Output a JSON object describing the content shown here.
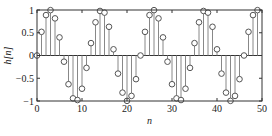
{
  "chart_data": {
    "type": "stem",
    "title": "",
    "xlabel": "n",
    "ylabel": "h[n]",
    "xlim": [
      0,
      50
    ],
    "ylim": [
      -1,
      1
    ],
    "grid": false,
    "legend": null,
    "xticks": [
      0,
      10,
      20,
      30,
      40,
      50
    ],
    "xtick_labels": [
      "0",
      "10",
      "20",
      "30",
      "40",
      "50"
    ],
    "yticks": [
      -1,
      -0.5,
      0,
      0.5,
      1
    ],
    "ytick_labels": [
      "−1",
      "−0.5",
      "0",
      "0.5",
      "1"
    ],
    "marker": "open-circle",
    "stem_color": "#888888",
    "marker_color": "#555555",
    "x": [
      0,
      1,
      2,
      3,
      4,
      5,
      6,
      7,
      8,
      9,
      10,
      11,
      12,
      13,
      14,
      15,
      16,
      17,
      18,
      19,
      20,
      21,
      22,
      23,
      24,
      25,
      26,
      27,
      28,
      29,
      30,
      31,
      32,
      33,
      34,
      35,
      36,
      37,
      38,
      39,
      40,
      41,
      42,
      43,
      44,
      45,
      46,
      47,
      48,
      49
    ],
    "values": [
      0.0,
      0.52,
      0.888,
      0.997,
      0.816,
      0.398,
      -0.136,
      -0.631,
      -0.942,
      -0.979,
      -0.73,
      -0.272,
      0.272,
      0.73,
      0.979,
      0.942,
      0.631,
      0.136,
      -0.398,
      -0.816,
      -0.997,
      -0.888,
      -0.52,
      0.0,
      0.52,
      0.888,
      0.997,
      0.816,
      0.398,
      -0.136,
      -0.631,
      -0.942,
      -0.979,
      -0.73,
      -0.272,
      0.272,
      0.73,
      0.979,
      0.942,
      0.631,
      0.136,
      -0.398,
      -0.816,
      -0.997,
      -0.888,
      -0.52,
      0.0,
      0.52,
      0.888,
      0.997
    ]
  }
}
